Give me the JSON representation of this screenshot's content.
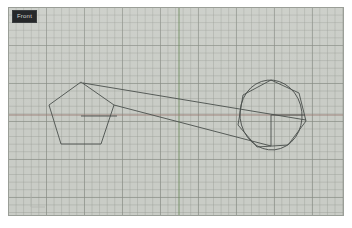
{
  "app": {
    "viewport_label": "Front",
    "background_color": "#c9ccc6",
    "border_color": "#9a9e97",
    "page_background": "#ffffff"
  },
  "viewport": {
    "width": 336,
    "height": 209,
    "grid": {
      "enabled": true,
      "fine_spacing_px": 7.6,
      "coarse_spacing_px": 38,
      "fine_color": "#969a93",
      "coarse_color": "#848981"
    }
  },
  "axes": {
    "vertical": {
      "name": "y-axis",
      "color": "#6d8a5c",
      "x": 170,
      "y1": 0,
      "y2": 209,
      "width": 1
    },
    "horizontal": {
      "name": "x-axis",
      "color": "#9a7b72",
      "y": 107,
      "x1": 0,
      "x2": 336,
      "width": 1
    }
  },
  "geometry": {
    "stroke_color": "#4a4f4c",
    "stroke_width": 0.9,
    "left_shape": {
      "name": "pentagon",
      "sides": 5,
      "center": [
        72,
        108
      ],
      "points": "72,74 105,97 92,136 52,136 40,97",
      "center_line": {
        "x1": 72,
        "y1": 108,
        "x2": 108,
        "y2": 108
      }
    },
    "right_polygon": {
      "name": "heptagon",
      "sides": 7,
      "center": [
        262,
        107
      ],
      "points": "262,72 290,85 297,113 279,137 248,139 229,117 234,87"
    },
    "right_circle": {
      "name": "circle",
      "center": [
        262,
        107
      ],
      "rx": 31,
      "ry": 35,
      "rotation": -6
    },
    "radius_lines": [
      {
        "name": "radius-horizontal",
        "x1": 262,
        "y1": 107,
        "x2": 296,
        "y2": 107
      },
      {
        "name": "radius-vertical",
        "x1": 262,
        "y1": 107,
        "x2": 262,
        "y2": 138
      }
    ],
    "connectors": [
      {
        "name": "tangent-upper",
        "x1": 74,
        "y1": 75,
        "x2": 297,
        "y2": 112
      },
      {
        "name": "tangent-lower",
        "x1": 105,
        "y1": 97,
        "x2": 262,
        "y2": 138
      }
    ]
  },
  "gizmo": {
    "name": "axis-gizmo",
    "origin": [
      22,
      199
    ],
    "arm_length": 14,
    "color": "#b3b7b0"
  }
}
